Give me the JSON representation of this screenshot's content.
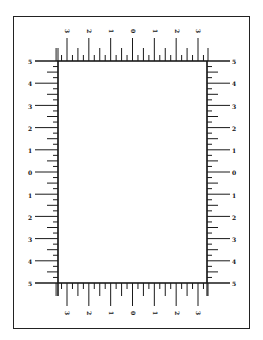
{
  "figure": {
    "frame": {
      "left": 13,
      "top": 16,
      "right": 250,
      "bottom": 329
    },
    "rect": {
      "left": 58,
      "top": 61,
      "right": 207,
      "bottom": 283
    },
    "stroke_color": "#1a1a1a",
    "background": "#ffffff"
  },
  "scales": {
    "top": {
      "labels": [
        "3",
        "2",
        "1",
        "0",
        "1",
        "2",
        "3"
      ],
      "major_x": [
        67,
        89,
        111,
        133,
        155,
        177,
        198
      ],
      "label_rotation": 90
    },
    "bottom": {
      "labels": [
        "3",
        "2",
        "1",
        "0",
        "1",
        "2",
        "3"
      ],
      "major_x": [
        67,
        89,
        111,
        133,
        155,
        177,
        198
      ],
      "label_rotation": 90
    },
    "left": {
      "labels": [
        "5",
        "4",
        "3",
        "2",
        "1",
        "0",
        "1",
        "2",
        "3",
        "4",
        "5"
      ],
      "major_y": [
        61,
        83,
        106,
        128,
        150,
        172,
        195,
        217,
        239,
        261,
        283
      ]
    },
    "right": {
      "labels": [
        "5",
        "4",
        "3",
        "2",
        "1",
        "0",
        "1",
        "2",
        "3",
        "4",
        "5"
      ],
      "major_y": [
        61,
        83,
        106,
        128,
        150,
        172,
        195,
        217,
        239,
        261,
        283
      ]
    }
  }
}
